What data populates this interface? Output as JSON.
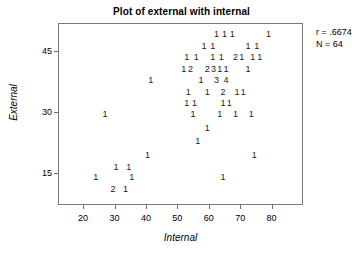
{
  "chart_data": {
    "type": "scatter",
    "title": "Plot of external with internal",
    "xlabel": "Internal",
    "ylabel": "External",
    "xlim": [
      12,
      90
    ],
    "ylim": [
      7,
      52
    ],
    "grid": false,
    "legend": null,
    "xticks": [
      20,
      30,
      40,
      50,
      60,
      70,
      80
    ],
    "yticks": [
      15,
      30,
      45
    ],
    "annotations": {
      "correlation_label": "r = .6674",
      "sample_size_label": "N = 64",
      "correlation": 0.6674,
      "n": 64
    },
    "points": [
      {
        "x": 62.5,
        "y": 49.2,
        "count": "1"
      },
      {
        "x": 65.0,
        "y": 49.2,
        "count": "1"
      },
      {
        "x": 67.5,
        "y": 49.2,
        "count": "1"
      },
      {
        "x": 79.0,
        "y": 49.2,
        "count": "1"
      },
      {
        "x": 58.5,
        "y": 46.4,
        "count": "1"
      },
      {
        "x": 61.3,
        "y": 46.4,
        "count": "1"
      },
      {
        "x": 72.5,
        "y": 46.4,
        "count": "1"
      },
      {
        "x": 75.3,
        "y": 46.4,
        "count": "1"
      },
      {
        "x": 53.0,
        "y": 43.5,
        "count": "1"
      },
      {
        "x": 56.0,
        "y": 43.5,
        "count": "1"
      },
      {
        "x": 61.3,
        "y": 43.5,
        "count": "1"
      },
      {
        "x": 64.0,
        "y": 43.5,
        "count": "1"
      },
      {
        "x": 68.5,
        "y": 43.5,
        "count": "2"
      },
      {
        "x": 70.5,
        "y": 43.5,
        "count": "1"
      },
      {
        "x": 74.0,
        "y": 43.5,
        "count": "1"
      },
      {
        "x": 76.2,
        "y": 43.5,
        "count": "1"
      },
      {
        "x": 52.0,
        "y": 40.6,
        "count": "1"
      },
      {
        "x": 54.2,
        "y": 40.6,
        "count": "2"
      },
      {
        "x": 59.5,
        "y": 40.6,
        "count": "2"
      },
      {
        "x": 61.5,
        "y": 40.6,
        "count": "3"
      },
      {
        "x": 63.5,
        "y": 40.6,
        "count": "1"
      },
      {
        "x": 65.5,
        "y": 40.6,
        "count": "1"
      },
      {
        "x": 72.5,
        "y": 40.6,
        "count": "1"
      },
      {
        "x": 41.5,
        "y": 37.8,
        "count": "1"
      },
      {
        "x": 57.5,
        "y": 37.8,
        "count": "1"
      },
      {
        "x": 62.5,
        "y": 37.8,
        "count": "3"
      },
      {
        "x": 65.5,
        "y": 37.8,
        "count": "4"
      },
      {
        "x": 53.5,
        "y": 35.0,
        "count": "1"
      },
      {
        "x": 59.5,
        "y": 35.0,
        "count": "1"
      },
      {
        "x": 64.5,
        "y": 35.0,
        "count": "2"
      },
      {
        "x": 69.0,
        "y": 35.0,
        "count": "1"
      },
      {
        "x": 71.0,
        "y": 35.0,
        "count": "1"
      },
      {
        "x": 53.0,
        "y": 32.2,
        "count": "1"
      },
      {
        "x": 55.5,
        "y": 32.2,
        "count": "1"
      },
      {
        "x": 64.5,
        "y": 32.2,
        "count": "1"
      },
      {
        "x": 66.5,
        "y": 32.2,
        "count": "1"
      },
      {
        "x": 27.0,
        "y": 29.4,
        "count": "1"
      },
      {
        "x": 55.0,
        "y": 29.4,
        "count": "1"
      },
      {
        "x": 63.5,
        "y": 29.4,
        "count": "1"
      },
      {
        "x": 68.5,
        "y": 29.4,
        "count": "1"
      },
      {
        "x": 73.5,
        "y": 29.4,
        "count": "1"
      },
      {
        "x": 59.5,
        "y": 26.0,
        "count": "1"
      },
      {
        "x": 56.5,
        "y": 22.8,
        "count": "1"
      },
      {
        "x": 40.5,
        "y": 19.4,
        "count": "1"
      },
      {
        "x": 74.5,
        "y": 19.4,
        "count": "1"
      },
      {
        "x": 30.5,
        "y": 16.4,
        "count": "1"
      },
      {
        "x": 34.5,
        "y": 16.4,
        "count": "1"
      },
      {
        "x": 24.0,
        "y": 14.0,
        "count": "1"
      },
      {
        "x": 35.5,
        "y": 14.0,
        "count": "1"
      },
      {
        "x": 64.5,
        "y": 14.0,
        "count": "1"
      },
      {
        "x": 29.5,
        "y": 11.0,
        "count": "2"
      },
      {
        "x": 33.5,
        "y": 11.0,
        "count": "1"
      }
    ]
  }
}
